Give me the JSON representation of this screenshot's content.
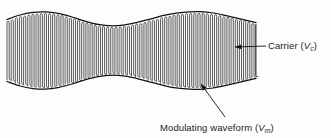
{
  "figure": {
    "type": "amplitude-modulation-waveform",
    "background_color": "#fdfdfd",
    "ink_color": "#111111",
    "carrier_color": "#3a3a3a"
  },
  "annotations": {
    "carrier": {
      "text_main": "Carrier (",
      "symbol": "V",
      "subscript": "c",
      "text_close": ")",
      "full_text": "Carrier (Vc)",
      "text_x": 268,
      "text_y": 49,
      "leader_from_x": 266,
      "leader_from_y": 46,
      "leader_to_x": 235,
      "leader_to_y": 47
    },
    "modulating": {
      "text_main": "Modulating waveform (",
      "symbol": "V",
      "subscript": "m",
      "text_close": ")",
      "full_text": "Modulating waveform (Vm)",
      "text_x": 160,
      "text_y": 131,
      "leader_from_x": 225,
      "leader_from_y": 117,
      "leader_to_x": 201,
      "leader_to_y": 84
    }
  },
  "chart_data": {
    "type": "line",
    "title": "",
    "xlabel": "",
    "ylabel": "",
    "xlim": [
      7,
      256
    ],
    "ylim": [
      0,
      138
    ],
    "grid": false,
    "legend": false,
    "geometry": {
      "x_start": 7,
      "x_end": 256,
      "center_y": 50.5,
      "carrier_count": 60,
      "carrier_period": 4.15,
      "envelope_mean_halfheight": 26.0,
      "envelope_mod_depth": 11.5,
      "envelope_cycles": 1.62,
      "envelope_phase_deg": 90
    },
    "series": [
      {
        "name": "Upper envelope",
        "comment": "peaks near x=45 and x=200, waist near x=112",
        "x": [
          7,
          20,
          33,
          45,
          58,
          72,
          85,
          98,
          112,
          125,
          138,
          152,
          165,
          178,
          190,
          200,
          213,
          226,
          240,
          256
        ],
        "y": [
          19.5,
          15.0,
          12.4,
          11.8,
          13.4,
          17.0,
          21.2,
          24.4,
          25.8,
          24.8,
          22.2,
          18.6,
          15.2,
          12.8,
          11.8,
          11.7,
          13.0,
          15.6,
          18.8,
          22.6
        ]
      },
      {
        "name": "Lower envelope",
        "comment": "mirror of upper envelope about the centre line",
        "x": [
          7,
          20,
          33,
          45,
          58,
          72,
          85,
          98,
          112,
          125,
          138,
          152,
          165,
          178,
          190,
          200,
          213,
          226,
          240,
          256
        ],
        "y": [
          81.5,
          86.0,
          88.6,
          89.2,
          87.6,
          84.0,
          79.8,
          76.6,
          75.2,
          76.2,
          78.8,
          82.4,
          85.8,
          88.2,
          89.2,
          89.3,
          88.0,
          85.4,
          82.2,
          78.4
        ]
      }
    ]
  }
}
